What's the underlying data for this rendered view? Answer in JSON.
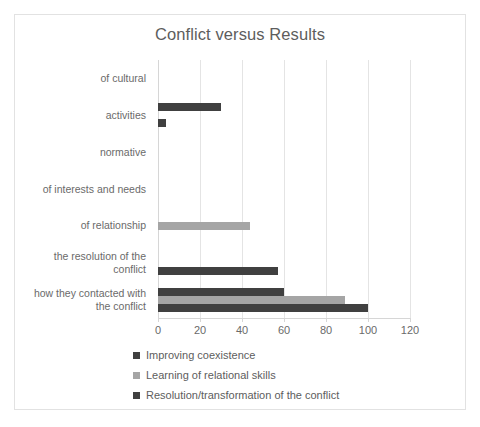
{
  "chart_data": {
    "type": "bar",
    "orientation": "horizontal",
    "title": "Conflict versus Results",
    "xlabel": "",
    "ylabel": "",
    "xlim": [
      0,
      120
    ],
    "xticks": [
      0,
      20,
      40,
      60,
      80,
      100,
      120
    ],
    "grid": true,
    "legend_position": "bottom-left",
    "categories": [
      "of cultural",
      "activities",
      "normative",
      "of interests and needs",
      "of relationship",
      "the resolution of the conflict",
      "how they contacted with the conflict"
    ],
    "series": [
      {
        "name": "Improving coexistence",
        "color": "#404040",
        "values": [
          0,
          30,
          0,
          0,
          0,
          0,
          60
        ]
      },
      {
        "name": "Learning of relational skills",
        "color": "#a5a5a5",
        "values": [
          0,
          0,
          0,
          0,
          44,
          0,
          89
        ]
      },
      {
        "name": "Resolution/transformation of the conflict",
        "color": "#404040",
        "values": [
          0,
          4,
          0,
          0,
          0,
          57,
          100
        ]
      }
    ]
  },
  "axis": {
    "tick_labels": [
      "0",
      "20",
      "40",
      "60",
      "80",
      "100",
      "120"
    ]
  },
  "category_labels": [
    {
      "lines": [
        "of cultural"
      ]
    },
    {
      "lines": [
        "activities"
      ]
    },
    {
      "lines": [
        "normative"
      ]
    },
    {
      "lines": [
        "of interests and needs"
      ]
    },
    {
      "lines": [
        "of relationship"
      ]
    },
    {
      "lines": [
        "the resolution of the",
        "conflict"
      ]
    },
    {
      "lines": [
        "how they contacted with",
        "the conflict"
      ]
    }
  ],
  "legend": [
    {
      "label": "Improving coexistence",
      "color": "#404040"
    },
    {
      "label": "Learning of relational skills",
      "color": "#a5a5a5"
    },
    {
      "label": "Resolution/transformation of the conflict",
      "color": "#404040"
    }
  ],
  "colors": {
    "series_dark": "#404040",
    "series_light": "#a5a5a5",
    "gridline": "#e4e4e4",
    "text": "#6a6a6a",
    "title_text": "#5d5d5d",
    "frame_border": "#e2e2e2",
    "background": "#ffffff"
  }
}
